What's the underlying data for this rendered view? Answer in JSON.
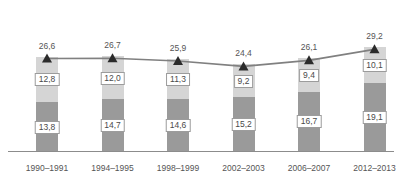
{
  "chart_data": {
    "type": "bar",
    "title": "",
    "subtitle": "",
    "xlabel": "",
    "ylabel": "",
    "grid": false,
    "legend": "none",
    "ylim": [
      0,
      30
    ],
    "categories": [
      "1990–1991",
      "1994–1995",
      "1998–1999",
      "2002–2003",
      "2006–2007",
      "2012–2013"
    ],
    "series": [
      {
        "name": "upper-segment",
        "color": "#d5d5d5",
        "values": [
          12.8,
          12.0,
          11.3,
          9.2,
          9.4,
          10.1
        ],
        "labels": [
          "12,8",
          "12,0",
          "11,3",
          "9,2",
          "9,4",
          "10,1"
        ]
      },
      {
        "name": "lower-segment",
        "color": "#9a9a9a",
        "values": [
          13.8,
          14.7,
          14.6,
          15.2,
          16.7,
          19.1
        ],
        "labels": [
          "13,8",
          "14,7",
          "14,6",
          "15,2",
          "16,7",
          "19,1"
        ]
      },
      {
        "name": "total-line",
        "type": "line",
        "color": "#808080",
        "marker": "triangle",
        "values": [
          26.6,
          26.7,
          25.9,
          24.4,
          26.1,
          29.2
        ],
        "labels": [
          "26,6",
          "26,7",
          "25,9",
          "24,4",
          "26,1",
          "29,2"
        ]
      }
    ]
  },
  "axis": {
    "baseline_color": "#8c8c8c"
  }
}
